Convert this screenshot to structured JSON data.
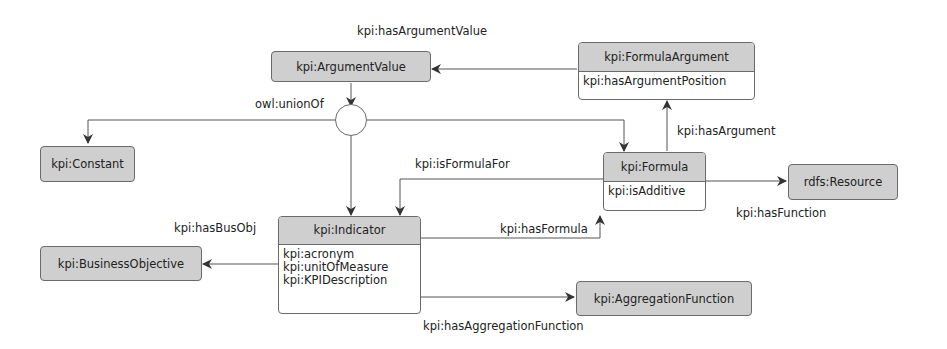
{
  "nodes": {
    "argument_value": {
      "title": "kpi:ArgumentValue"
    },
    "formula_argument": {
      "title": "kpi:FormulaArgument",
      "attributes": [
        "kpi:hasArgumentPosition"
      ]
    },
    "constant": {
      "title": "kpi:Constant"
    },
    "formula": {
      "title": "kpi:Formula",
      "attributes": [
        "kpi:isAdditive"
      ]
    },
    "resource": {
      "title": "rdfs:Resource"
    },
    "indicator": {
      "title": "kpi:Indicator",
      "attributes": [
        "kpi:acronym",
        "kpi:unitOfMeasure",
        "kpi:KPIDescription"
      ]
    },
    "business_objective": {
      "title": "kpi:BusinessObjective"
    },
    "aggregation_function": {
      "title": "kpi:AggregationFunction"
    }
  },
  "edges": {
    "has_argument_value": "kpi:hasArgumentValue",
    "union_of": "owl:unionOf",
    "has_argument": "kpi:hasArgument",
    "is_formula_for": "kpi:isFormulaFor",
    "has_function": "kpi:hasFunction",
    "has_bus_obj": "kpi:hasBusObj",
    "has_formula": "kpi:hasFormula",
    "has_aggregation_function": "kpi:hasAggregationFunction"
  },
  "colors": {
    "node_header": "#cfcfcf",
    "border": "#6a6a6a",
    "edge": "#444444"
  }
}
